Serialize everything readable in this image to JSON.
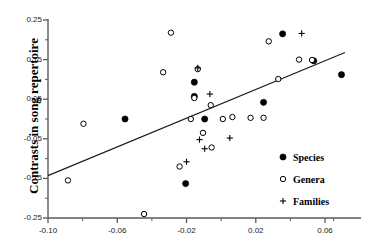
{
  "chart_data": {
    "type": "scatter",
    "title": "",
    "xlabel": "",
    "ylabel": "Contrasts in song repertoire",
    "xlim": [
      -0.1,
      0.075
    ],
    "ylim": [
      -0.25,
      0.25
    ],
    "grid": false,
    "xticks": [
      -0.1,
      -0.06,
      -0.02,
      0.02,
      0.06
    ],
    "xtick_labels": [
      "-0.10",
      "-0.06",
      "-0.02",
      "0.02",
      "0.06"
    ],
    "yticks": [
      0.25,
      0.15,
      0.05,
      -0.05,
      -0.15,
      -0.25
    ],
    "ytick_labels": [
      "0.25",
      "0.15",
      "0.05",
      "-0.05",
      "-0.15",
      "-0.25"
    ],
    "minor_xticks": [
      -0.08,
      -0.04,
      0.0,
      0.04,
      0.065
    ],
    "minor_yticks": [
      0.2,
      0.1,
      0.0,
      -0.1,
      -0.2
    ],
    "legend_position": "lower-right",
    "series": [
      {
        "name": "Species",
        "marker": "filled-circle",
        "color": "#000000",
        "points": [
          {
            "x": -0.0555,
            "y": 0.0
          },
          {
            "x": -0.0155,
            "y": 0.093
          },
          {
            "x": -0.0155,
            "y": 0.057
          },
          {
            "x": -0.0095,
            "y": 0.0
          },
          {
            "x": -0.0205,
            "y": -0.163
          },
          {
            "x": 0.0245,
            "y": 0.042
          },
          {
            "x": 0.0355,
            "y": 0.215
          },
          {
            "x": 0.0535,
            "y": 0.147
          },
          {
            "x": 0.0695,
            "y": 0.112
          }
        ]
      },
      {
        "name": "Genera",
        "marker": "open-circle",
        "color": "#000000",
        "points": [
          {
            "x": -0.0885,
            "y": -0.155
          },
          {
            "x": -0.0795,
            "y": -0.012
          },
          {
            "x": -0.0445,
            "y": -0.24
          },
          {
            "x": -0.0335,
            "y": 0.118
          },
          {
            "x": -0.029,
            "y": 0.218
          },
          {
            "x": -0.024,
            "y": -0.12
          },
          {
            "x": -0.0175,
            "y": 0.0
          },
          {
            "x": -0.0155,
            "y": 0.053
          },
          {
            "x": -0.0135,
            "y": 0.126
          },
          {
            "x": -0.0105,
            "y": -0.035
          },
          {
            "x": -0.006,
            "y": 0.035
          },
          {
            "x": -0.0055,
            "y": -0.072
          },
          {
            "x": 0.001,
            "y": 0.0
          },
          {
            "x": 0.0065,
            "y": 0.005
          },
          {
            "x": 0.017,
            "y": 0.003
          },
          {
            "x": 0.0245,
            "y": 0.003
          },
          {
            "x": 0.0275,
            "y": 0.196
          },
          {
            "x": 0.033,
            "y": 0.101
          },
          {
            "x": 0.045,
            "y": 0.15
          },
          {
            "x": 0.0525,
            "y": 0.149
          }
        ]
      },
      {
        "name": "Families",
        "marker": "plus",
        "color": "#000000",
        "points": [
          {
            "x": -0.02,
            "y": -0.108
          },
          {
            "x": -0.0135,
            "y": 0.129
          },
          {
            "x": -0.0125,
            "y": -0.052
          },
          {
            "x": -0.0095,
            "y": -0.075
          },
          {
            "x": -0.0065,
            "y": 0.063
          },
          {
            "x": 0.005,
            "y": -0.048
          },
          {
            "x": 0.0465,
            "y": 0.216
          }
        ]
      }
    ],
    "trendline": {
      "x1": -0.1,
      "y1": -0.143,
      "x2": 0.0715,
      "y2": 0.168
    }
  },
  "legend": {
    "entries": [
      {
        "label": "Species",
        "marker": "filled-circle"
      },
      {
        "label": "Genera",
        "marker": "open-circle"
      },
      {
        "label": "Families",
        "marker": "plus"
      }
    ]
  }
}
